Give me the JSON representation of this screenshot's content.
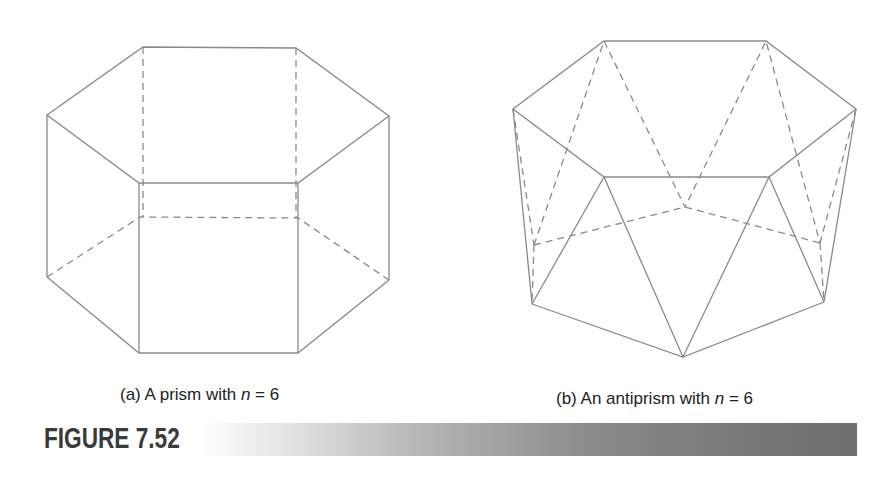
{
  "figure": {
    "label": "FIGURE 7.52",
    "bar_gradient": [
      "#ffffff",
      "#6f6f6f"
    ],
    "line_color": "#8a8a8a"
  },
  "panels": [
    {
      "id": "a",
      "caption_prefix": "(a) A prism with ",
      "caption_var": "n",
      "caption_suffix": " = 6",
      "shape": "hexagonal prism",
      "n": 6
    },
    {
      "id": "b",
      "caption_prefix": "(b) An antiprism with ",
      "caption_var": "n",
      "caption_suffix": " = 6",
      "shape": "hexagonal antiprism",
      "n": 6
    }
  ]
}
